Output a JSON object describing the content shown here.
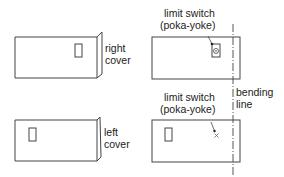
{
  "diagram": {
    "panels": [
      {
        "id": "top-left",
        "label_line1": "right",
        "label_line2": "cover"
      },
      {
        "id": "top-right",
        "callout_line1": "limit switch",
        "callout_line2": "(poka-yoke)",
        "switch_state": "engaged"
      },
      {
        "id": "bottom-left",
        "label_line1": "left",
        "label_line2": "cover"
      },
      {
        "id": "bottom-right",
        "callout_line1": "limit switch",
        "callout_line2": "(poka-yoke)",
        "switch_state": "not-engaged"
      }
    ],
    "bending_line": {
      "label_line1": "bending",
      "label_line2": "line"
    },
    "colors": {
      "stroke": "#444444",
      "background": "#ffffff"
    }
  }
}
